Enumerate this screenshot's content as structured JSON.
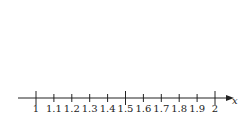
{
  "diagram": {
    "type": "number-line",
    "axis_label": "x",
    "range": [
      1,
      2
    ],
    "step": 0.1,
    "ticks": [
      {
        "value": 1,
        "label": "1",
        "major": true
      },
      {
        "value": 1.1,
        "label": "1.1",
        "major": false
      },
      {
        "value": 1.2,
        "label": "1.2",
        "major": false
      },
      {
        "value": 1.3,
        "label": "1.3",
        "major": false
      },
      {
        "value": 1.4,
        "label": "1.4",
        "major": false
      },
      {
        "value": 1.5,
        "label": "1.5",
        "major": true
      },
      {
        "value": 1.6,
        "label": "1.6",
        "major": false
      },
      {
        "value": 1.7,
        "label": "1.7",
        "major": false
      },
      {
        "value": 1.8,
        "label": "1.8",
        "major": false
      },
      {
        "value": 1.9,
        "label": "1.9",
        "major": false
      },
      {
        "value": 2,
        "label": "2",
        "major": true
      }
    ],
    "colors": {
      "line": "#222222",
      "background": "#ffffff"
    }
  }
}
